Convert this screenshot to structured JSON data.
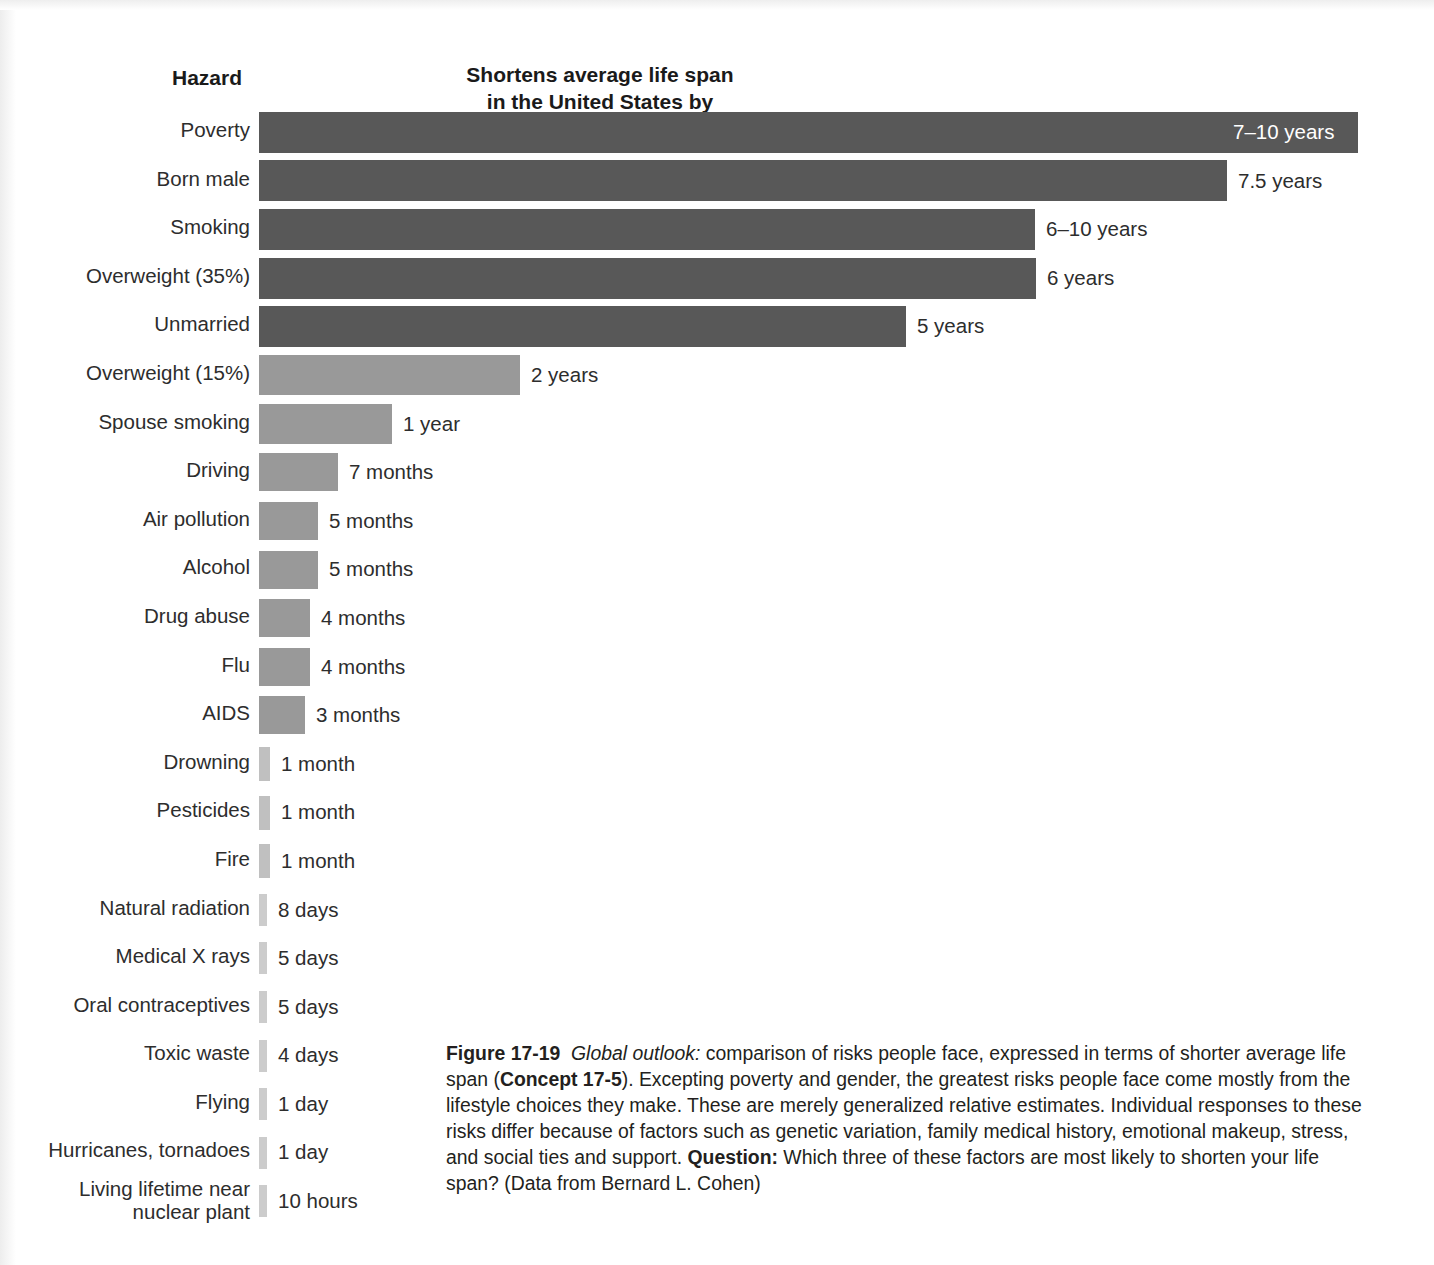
{
  "headers": {
    "hazard": "Hazard",
    "metric_line1": "Shortens average life span",
    "metric_line2": "in the United States by"
  },
  "colors": {
    "bar_dark": "#585858",
    "bar_mid": "#999999",
    "bar_light": "#c0c0c0",
    "bar_lighter": "#cccccc",
    "text": "#2d2d2d",
    "value_inside": "#ffffff"
  },
  "chart_data": {
    "type": "bar",
    "title": "Shortens average life span in the United States by",
    "xlabel": "",
    "ylabel": "Hazard",
    "orientation": "horizontal",
    "grid": false,
    "legend": "none",
    "axis_note": "No numeric axis shown; bar lengths are proportional to life-span reduction, values given as text labels",
    "categories": [
      "Poverty",
      "Born male",
      "Smoking",
      "Overweight (35%)",
      "Unmarried",
      "Overweight (15%)",
      "Spouse smoking",
      "Driving",
      "Air pollution",
      "Alcohol",
      "Drug abuse",
      "Flu",
      "AIDS",
      "Drowning",
      "Pesticides",
      "Fire",
      "Natural radiation",
      "Medical X rays",
      "Oral contraceptives",
      "Toxic waste",
      "Flying",
      "Hurricanes, tornadoes",
      "Living lifetime near\nnuclear plant"
    ],
    "value_labels": [
      "7–10 years",
      "7.5 years",
      "6–10 years",
      "6 years",
      "5 years",
      "2 years",
      "1 year",
      "7 months",
      "5 months",
      "5 months",
      "4 months",
      "4 months",
      "3 months",
      "1 month",
      "1 month",
      "1 month",
      "8 days",
      "5 days",
      "5 days",
      "4 days",
      "1 day",
      "1 day",
      "10 hours"
    ],
    "values_years": [
      8.5,
      7.5,
      8.0,
      6.0,
      5.0,
      2.0,
      1.0,
      0.583,
      0.417,
      0.417,
      0.333,
      0.333,
      0.25,
      0.083,
      0.083,
      0.083,
      0.0219,
      0.0137,
      0.0137,
      0.011,
      0.0027,
      0.0027,
      0.00114
    ],
    "rows": [
      {
        "label": "Poverty",
        "value": "7–10 years",
        "bar_px": 1099,
        "shade": "bar_dark",
        "label_inside": true
      },
      {
        "label": "Born male",
        "value": "7.5 years",
        "bar_px": 968,
        "shade": "bar_dark",
        "label_inside": false
      },
      {
        "label": "Smoking",
        "value": "6–10 years",
        "bar_px": 776,
        "shade": "bar_dark",
        "label_inside": false
      },
      {
        "label": "Overweight (35%)",
        "value": "6 years",
        "bar_px": 777,
        "shade": "bar_dark",
        "label_inside": false
      },
      {
        "label": "Unmarried",
        "value": "5 years",
        "bar_px": 647,
        "shade": "bar_dark",
        "label_inside": false
      },
      {
        "label": "Overweight (15%)",
        "value": "2 years",
        "bar_px": 261,
        "shade": "bar_mid",
        "label_inside": false
      },
      {
        "label": "Spouse smoking",
        "value": "1 year",
        "bar_px": 133,
        "shade": "bar_mid",
        "label_inside": false
      },
      {
        "label": "Driving",
        "value": "7 months",
        "bar_px": 79,
        "shade": "bar_mid",
        "label_inside": false
      },
      {
        "label": "Air pollution",
        "value": "5 months",
        "bar_px": 59,
        "shade": "bar_mid",
        "label_inside": false
      },
      {
        "label": "Alcohol",
        "value": "5 months",
        "bar_px": 59,
        "shade": "bar_mid",
        "label_inside": false
      },
      {
        "label": "Drug abuse",
        "value": "4 months",
        "bar_px": 51,
        "shade": "bar_mid",
        "label_inside": false
      },
      {
        "label": "Flu",
        "value": "4 months",
        "bar_px": 51,
        "shade": "bar_mid",
        "label_inside": false
      },
      {
        "label": "AIDS",
        "value": "3 months",
        "bar_px": 46,
        "shade": "bar_mid",
        "label_inside": false
      },
      {
        "label": "Drowning",
        "value": "1 month",
        "bar_px": 11,
        "shade": "bar_light",
        "label_inside": false
      },
      {
        "label": "Pesticides",
        "value": "1 month",
        "bar_px": 11,
        "shade": "bar_light",
        "label_inside": false
      },
      {
        "label": "Fire",
        "value": "1 month",
        "bar_px": 11,
        "shade": "bar_light",
        "label_inside": false
      },
      {
        "label": "Natural radiation",
        "value": "8 days",
        "bar_px": 8,
        "shade": "bar_lighter",
        "label_inside": false
      },
      {
        "label": "Medical X rays",
        "value": "5 days",
        "bar_px": 8,
        "shade": "bar_lighter",
        "label_inside": false
      },
      {
        "label": "Oral contraceptives",
        "value": "5 days",
        "bar_px": 8,
        "shade": "bar_lighter",
        "label_inside": false
      },
      {
        "label": "Toxic waste",
        "value": "4 days",
        "bar_px": 8,
        "shade": "bar_lighter",
        "label_inside": false
      },
      {
        "label": "Flying",
        "value": "1 day",
        "bar_px": 8,
        "shade": "bar_lighter",
        "label_inside": false
      },
      {
        "label": "Hurricanes, tornadoes",
        "value": "1 day",
        "bar_px": 8,
        "shade": "bar_lighter",
        "label_inside": false
      },
      {
        "label": "Living lifetime near\nnuclear plant",
        "value": "10 hours",
        "bar_px": 8,
        "shade": "bar_lighter",
        "label_inside": false
      }
    ]
  },
  "caption": {
    "figure_number": "Figure 17-19",
    "emphasis": "Global outlook:",
    "text_1": " comparison of risks people face, expressed in terms of shorter average life span (",
    "concept": "Concept 17-5",
    "text_2": "). Excepting poverty and gender, the greatest risks people face come mostly from the lifestyle choices they make. These are merely generalized relative estimates. Individual responses to these risks differ because of factors such as genetic variation, family medical history, emotional makeup, stress, and social ties and support. ",
    "question_label": "Question:",
    "text_3": " Which three of these factors are most likely to shorten your life span? (Data from Bernard L. Cohen)"
  }
}
